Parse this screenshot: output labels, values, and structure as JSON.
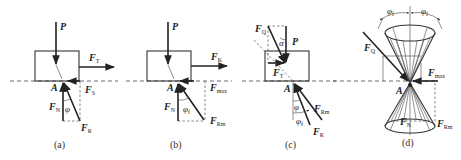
{
  "figure": {
    "panels": [
      {
        "id": "a",
        "caption": "(a)",
        "labels": {
          "P": "P",
          "FT": {
            "main": "F",
            "sub": "T"
          },
          "FS": {
            "main": "F",
            "sub": "S"
          },
          "FN": {
            "main": "F",
            "sub": "N"
          },
          "FR": {
            "main": "F",
            "sub": "R"
          },
          "A": "A",
          "angle": "φ"
        }
      },
      {
        "id": "b",
        "caption": "(b)",
        "labels": {
          "P": "P",
          "FK": {
            "main": "F",
            "sub": "K"
          },
          "Fmax": {
            "main": "F",
            "sub": "max"
          },
          "FN": {
            "main": "F",
            "sub": "N"
          },
          "FRm": {
            "main": "F",
            "sub": "Rm"
          },
          "A": "A",
          "angle": {
            "main": "φ",
            "sub": "f"
          }
        }
      },
      {
        "id": "c",
        "caption": "(c)",
        "labels": {
          "P": "P",
          "FQ": {
            "main": "F",
            "sub": "Q"
          },
          "FT": {
            "main": "F",
            "sub": "T"
          },
          "alpha": "α",
          "FRm": {
            "main": "F",
            "sub": "Rm"
          },
          "FR": {
            "main": "F",
            "sub": "R"
          },
          "A": "A",
          "angle1": "φ",
          "angle2": {
            "main": "φ",
            "sub": "f"
          }
        }
      },
      {
        "id": "d",
        "caption": "(d)",
        "labels": {
          "FQ": {
            "main": "F",
            "sub": "Q"
          },
          "Fmax": {
            "main": "F",
            "sub": "max"
          },
          "FN": {
            "main": "F",
            "sub": "N"
          },
          "FRm": {
            "main": "F",
            "sub": "Rm"
          },
          "A": "A",
          "angle_left": {
            "main": "φ",
            "sub": "f"
          },
          "angle_right": {
            "main": "φ",
            "sub": "f"
          }
        }
      }
    ]
  }
}
